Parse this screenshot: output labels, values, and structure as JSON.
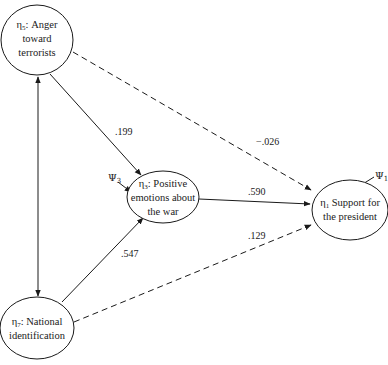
{
  "diagram": {
    "type": "path-model",
    "nodes": [
      {
        "id": "eta5",
        "symbol": "η",
        "subscript": "5",
        "lines": [
          ": Anger",
          "toward",
          "terrorists"
        ]
      },
      {
        "id": "eta3",
        "symbol": "η",
        "subscript": "3",
        "lines": [
          ": Positive",
          "emotions about",
          "the war"
        ]
      },
      {
        "id": "eta1",
        "symbol": "η",
        "subscript": "1",
        "lines": [
          " Support for",
          "the president"
        ]
      },
      {
        "id": "eta7",
        "symbol": "η",
        "subscript": "7",
        "lines": [
          ": National",
          "identification"
        ]
      }
    ],
    "edges": [
      {
        "from": "eta5",
        "to": "eta3",
        "style": "solid",
        "label": ".199"
      },
      {
        "from": "eta5",
        "to": "eta1",
        "style": "dashed",
        "label": "−.026"
      },
      {
        "from": "eta3",
        "to": "eta1",
        "style": "solid",
        "label": ".590"
      },
      {
        "from": "eta7",
        "to": "eta1",
        "style": "dashed",
        "label": ".129"
      },
      {
        "from": "eta7",
        "to": "eta3",
        "style": "solid",
        "label": ".547"
      },
      {
        "from": "eta5",
        "to": "eta7",
        "style": "solid-bidirectional",
        "label": ""
      }
    ],
    "disturbances": [
      {
        "symbol": "Ψ",
        "subscript": "3",
        "target": "eta3"
      },
      {
        "symbol": "Ψ",
        "subscript": "1",
        "target": "eta1"
      }
    ]
  },
  "colors": {
    "stroke": "#1a1a1a",
    "background": "#ffffff"
  }
}
